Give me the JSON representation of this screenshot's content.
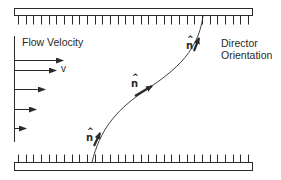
{
  "diagram": {
    "type": "nematic-liquid-crystal-shear-flow",
    "labels": {
      "flow_velocity": "Flow Velocity",
      "velocity_symbol": "v",
      "director_line1": "Director",
      "director_line2": "Orientation",
      "director_symbol": "n",
      "director_hat": "^"
    },
    "colors": {
      "stroke": "#2a2a2a",
      "wall_fill": "#ffffff",
      "background": "#ffffff"
    },
    "walls": {
      "top": {
        "x": 14,
        "y": 8,
        "width": 238,
        "height": 7,
        "tick_length": 9,
        "tick_direction": "down"
      },
      "bottom": {
        "x": 14,
        "y": 162,
        "width": 238,
        "height": 8,
        "tick_length": 8,
        "tick_direction": "up"
      },
      "tick_count": 31
    },
    "flow_profile": {
      "axis_x": 14,
      "axis_y_start": 36,
      "axis_y_end": 142,
      "arrows": [
        {
          "y": 60,
          "x_end": 63
        },
        {
          "y": 70,
          "x_end": 56
        },
        {
          "y": 89,
          "x_end": 45
        },
        {
          "y": 109,
          "x_end": 36
        },
        {
          "y": 128,
          "x_end": 26
        }
      ]
    },
    "director_curve": {
      "path": "M 92 162 C 100 130, 115 112, 140 94 C 170 74, 198 55, 203 16",
      "arrows": [
        {
          "x1": 94,
          "y1": 146,
          "x2": 100,
          "y2": 133
        },
        {
          "x1": 135,
          "y1": 96,
          "x2": 152,
          "y2": 86
        },
        {
          "x1": 194,
          "y1": 51,
          "x2": 199,
          "y2": 38
        }
      ],
      "n_labels": [
        {
          "x": 86,
          "y": 133
        },
        {
          "x": 131,
          "y": 79
        },
        {
          "x": 186,
          "y": 41
        }
      ]
    }
  }
}
